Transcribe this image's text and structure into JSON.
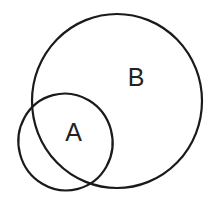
{
  "diagram": {
    "type": "venn",
    "sets": [
      {
        "name": "B",
        "label": "B"
      },
      {
        "name": "A",
        "label": "A"
      }
    ],
    "stroke_color": "#1a1a1a",
    "background": "#ffffff"
  }
}
